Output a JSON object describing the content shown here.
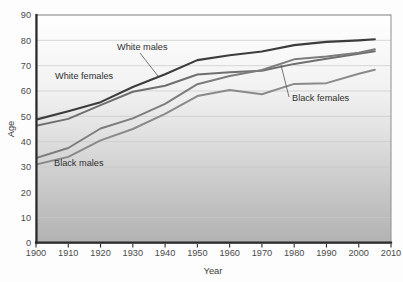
{
  "chart_data": {
    "type": "line",
    "title": "",
    "xlabel": "Year",
    "ylabel": "Age",
    "xlim": [
      1900,
      2010
    ],
    "ylim": [
      0,
      90
    ],
    "xticks": [
      1900,
      1910,
      1920,
      1930,
      1940,
      1950,
      1960,
      1970,
      1980,
      1990,
      2000,
      2010
    ],
    "yticks": [
      0,
      10,
      20,
      30,
      40,
      50,
      60,
      70,
      80,
      90
    ],
    "xtick_labels": [
      "1900",
      "1910",
      "1920",
      "1930",
      "1940",
      "1950",
      "1960",
      "1970",
      "1980",
      "1990",
      "2000",
      "2010"
    ],
    "ytick_labels": [
      "0",
      "10",
      "20",
      "30",
      "40",
      "50",
      "60",
      "70",
      "80",
      "90"
    ],
    "grid": "horizontal",
    "legend": "inline-annotations",
    "x": [
      1900,
      1910,
      1920,
      1930,
      1940,
      1950,
      1960,
      1970,
      1980,
      1990,
      2000,
      2005
    ],
    "series": [
      {
        "name": "White females",
        "label": "White females",
        "color": "#3c3c3c",
        "width": 2.1,
        "values": [
          48.7,
          52.0,
          55.6,
          61.6,
          66.6,
          72.2,
          74.1,
          75.6,
          78.1,
          79.4,
          80.0,
          80.4
        ]
      },
      {
        "name": "White males",
        "label": "White males",
        "color": "#6f6f6f",
        "width": 2.0,
        "values": [
          46.3,
          49.0,
          54.4,
          59.7,
          62.1,
          66.5,
          67.4,
          68.0,
          70.7,
          72.7,
          74.7,
          75.7
        ]
      },
      {
        "name": "Black females",
        "label": "Black females",
        "color": "#7d7d7d",
        "width": 2.0,
        "values": [
          33.5,
          37.5,
          45.2,
          49.2,
          54.9,
          62.7,
          65.9,
          68.3,
          72.5,
          73.6,
          75.1,
          76.5
        ]
      },
      {
        "name": "Black males",
        "label": "Black males",
        "color": "#8a8a8a",
        "width": 2.0,
        "values": [
          31.0,
          34.0,
          40.5,
          45.0,
          51.0,
          58.0,
          60.4,
          58.7,
          62.8,
          63.1,
          66.8,
          68.4
        ]
      }
    ],
    "annotations": [
      {
        "name": "white-males",
        "text": "White males",
        "text_x": 117,
        "text_y": 50,
        "leader_from": [
          140,
          53
        ],
        "leader_to": [
          158,
          76
        ]
      },
      {
        "name": "white-females",
        "text": "White females",
        "text_x": 55,
        "text_y": 79,
        "leader_from": null,
        "leader_to": null
      },
      {
        "name": "black-females",
        "text": "Black females",
        "text_x": 292,
        "text_y": 101,
        "leader_from": [
          289,
          97
        ],
        "leader_to": [
          281,
          65
        ]
      },
      {
        "name": "black-males",
        "text": "Black males",
        "text_x": 54,
        "text_y": 166,
        "leader_from": null,
        "leader_to": null
      }
    ]
  },
  "axes": {
    "x_title": "Year",
    "y_title": "Age"
  }
}
